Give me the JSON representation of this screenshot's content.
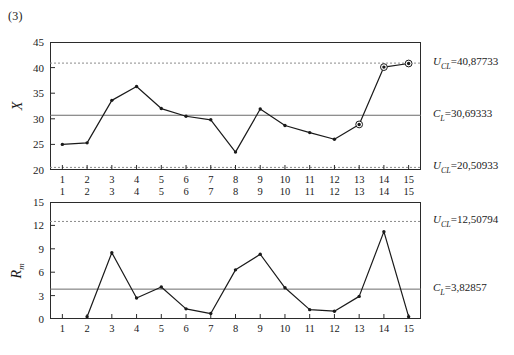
{
  "figure": {
    "label": "(3)",
    "colors": {
      "line": "#1a1a1a",
      "marker_fill": "#1a1a1a",
      "frame": "#2b2b2b",
      "center_line": "#6b6b6b",
      "limit_line": "#8a8a8a",
      "text": "#1a1a1a",
      "background": "#ffffff"
    }
  },
  "chart_data": [
    {
      "type": "line",
      "name": "individuals-chart",
      "title": "(3)",
      "xlabel": "",
      "ylabel": "X",
      "x": [
        1,
        2,
        3,
        4,
        5,
        6,
        7,
        8,
        9,
        10,
        11,
        12,
        13,
        14,
        15
      ],
      "xticklabels": [
        "1",
        "2",
        "3",
        "4",
        "5",
        "6",
        "7",
        "8",
        "9",
        "10",
        "11",
        "12",
        "13",
        "14",
        "15"
      ],
      "values": [
        25.0,
        25.3,
        33.6,
        36.3,
        32.0,
        30.5,
        29.8,
        23.5,
        31.9,
        28.7,
        27.3,
        26.0,
        28.9,
        40.1,
        40.8
      ],
      "yticks": [
        20,
        25,
        30,
        35,
        40,
        45
      ],
      "yticklabels": [
        "20",
        "25",
        "30",
        "35",
        "40",
        "45"
      ],
      "ylim": [
        20,
        45
      ],
      "xlim": [
        0.5,
        15.5
      ],
      "grid": false,
      "highlighted_points": [
        13,
        14,
        15
      ],
      "reference_lines": [
        {
          "name": "upper-control-limit",
          "value": 40.87733,
          "style": "dotted",
          "label_prefix": "U",
          "label_sub": "CL",
          "label_value": "40,87733",
          "label_text": "U_CL = 40,87733"
        },
        {
          "name": "center-line",
          "value": 30.69333,
          "style": "solid",
          "label_prefix": "C",
          "label_sub": "L",
          "label_value": "30,69333",
          "label_text": "C_L = 30,69333"
        },
        {
          "name": "lower-control-limit",
          "value": 20.50933,
          "style": "dotted",
          "label_prefix": "U",
          "label_sub": "CL",
          "label_value": "20,50933",
          "label_text": "U_CL = 20,50933"
        }
      ]
    },
    {
      "type": "line",
      "name": "moving-range-chart",
      "title": "",
      "xlabel": "",
      "ylabel": "Rm",
      "x": [
        2,
        3,
        4,
        5,
        6,
        7,
        8,
        9,
        10,
        11,
        12,
        13,
        14,
        15
      ],
      "xticklabels": [
        "1",
        "2",
        "3",
        "4",
        "5",
        "6",
        "7",
        "8",
        "9",
        "10",
        "11",
        "12",
        "13",
        "14",
        "15"
      ],
      "values": [
        0.3,
        8.5,
        2.7,
        4.1,
        1.3,
        0.7,
        6.3,
        8.3,
        4.0,
        1.2,
        1.0,
        2.9,
        11.2,
        0.3
      ],
      "yticks": [
        0,
        3,
        6,
        9,
        12,
        15
      ],
      "yticklabels": [
        "0",
        "3",
        "6",
        "9",
        "12",
        "15"
      ],
      "ylim": [
        0,
        15
      ],
      "xlim": [
        0.5,
        15.5
      ],
      "grid": false,
      "highlighted_points": [],
      "reference_lines": [
        {
          "name": "upper-control-limit",
          "value": 12.50794,
          "style": "dotted",
          "label_prefix": "U",
          "label_sub": "CL",
          "label_value": "12,50794",
          "label_text": "U_CL = 12,50794"
        },
        {
          "name": "center-line",
          "value": 3.82857,
          "style": "solid",
          "label_prefix": "C",
          "label_sub": "L",
          "label_value": "3,82857",
          "label_text": "C_L = 3,82857"
        }
      ]
    }
  ]
}
